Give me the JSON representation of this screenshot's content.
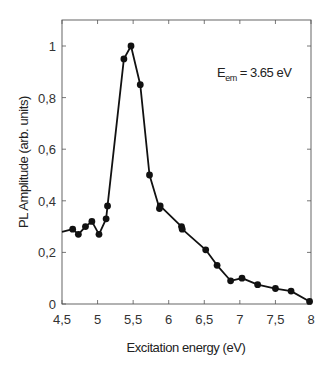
{
  "chart_data": {
    "type": "line",
    "title": "",
    "xlabel": "Excitation energy (eV)",
    "ylabel": "PL Amplitude (arb. units)",
    "xlim": [
      4.5,
      8
    ],
    "ylim": [
      0,
      1.1
    ],
    "xticks": [
      "4,5",
      "5",
      "5,5",
      "6",
      "6,5",
      "7",
      "7,5",
      "8"
    ],
    "yticks": [
      "0",
      "0,2",
      "0,4",
      "0,6",
      "0,8",
      "1"
    ],
    "grid": false,
    "legend": null,
    "annotation": {
      "main": "E",
      "sub": "em",
      "rest": " = 3.65 eV"
    },
    "series": [
      {
        "name": "PL amplitude",
        "line_start": {
          "x": 4.5,
          "y": 0.28
        },
        "x": [
          4.65,
          4.73,
          4.83,
          4.92,
          5.02,
          5.12,
          5.14,
          5.37,
          5.47,
          5.6,
          5.73,
          5.87,
          5.88,
          6.18,
          6.19,
          6.52,
          6.68,
          6.87,
          7.03,
          7.25,
          7.5,
          7.72,
          7.98
        ],
        "y": [
          0.29,
          0.27,
          0.3,
          0.32,
          0.27,
          0.33,
          0.38,
          0.95,
          1.0,
          0.85,
          0.5,
          0.37,
          0.38,
          0.3,
          0.29,
          0.21,
          0.15,
          0.09,
          0.1,
          0.075,
          0.06,
          0.05,
          0.01
        ]
      }
    ]
  }
}
